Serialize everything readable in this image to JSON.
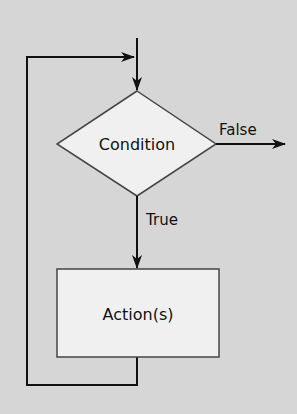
{
  "diagram": {
    "type": "flowchart",
    "colors": {
      "background": "#d6d6d6",
      "shape_fill": "#f0f0f0",
      "stroke_shape": "#444444",
      "stroke_line": "#111111"
    },
    "nodes": {
      "condition": {
        "shape": "diamond",
        "label": "Condition"
      },
      "action": {
        "shape": "rectangle",
        "label": "Action(s)"
      }
    },
    "edges": {
      "false_label": "False",
      "true_label": "True"
    }
  }
}
